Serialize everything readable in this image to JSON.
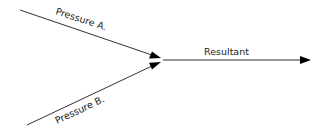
{
  "diagram": {
    "type": "force-vector-diagram",
    "labels": {
      "pressure_a": "Pressure A.",
      "pressure_b": "Pressure B.",
      "resultant": "Resultant"
    },
    "colors": {
      "line": "#333333",
      "arrow": "#000000",
      "text": "#222222"
    },
    "vectors": [
      {
        "name": "Pressure A.",
        "from": [
          20,
          10
        ],
        "to": [
          160,
          58
        ]
      },
      {
        "name": "Pressure B.",
        "from": [
          27,
          125
        ],
        "to": [
          160,
          62
        ]
      },
      {
        "name": "Resultant",
        "from": [
          163,
          60
        ],
        "to": [
          311,
          60
        ]
      }
    ]
  }
}
